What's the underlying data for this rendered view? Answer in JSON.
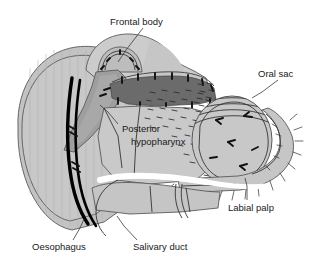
{
  "figure": {
    "background_color": "#ffffff",
    "width": 320,
    "height": 267
  },
  "palette": {
    "head_capsule": "#c3c3c3",
    "head_capsule_light": "#cfcfcf",
    "pharynx_dark": "#6b6b6b",
    "pharynx_mid": "#9a9a9a",
    "oral_sac": "#c8c8c8",
    "labial_palp": "#c6c6c6",
    "oesophagus": "#000000",
    "outline": "#5a5a5a",
    "label_text": "#1a1a1a",
    "leader_line": "#3a3a3a",
    "white_band": "#ffffff"
  },
  "labels": [
    {
      "id": "frontal-body",
      "text": "Frontal body",
      "x": 110,
      "y": 22,
      "anchor": "start",
      "leader": "M 143 28 L 126 50 L 118 62"
    },
    {
      "id": "oral-sac",
      "text": "Oral sac",
      "x": 258,
      "y": 74,
      "anchor": "start",
      "leader": "M 278 80 L 262 92 L 252 98"
    },
    {
      "id": "posterior-hypopharynx",
      "line1": "Posterior",
      "line2": "hypopharynx",
      "x": 122,
      "y": 129,
      "x2": 131,
      "y2": 142,
      "anchor": "start",
      "leader": "M 118 124 L 108 112 L 100 105"
    },
    {
      "id": "labial-palp",
      "text": "Labial palp",
      "x": 228,
      "y": 208,
      "anchor": "start",
      "leader": "M 247 200 L 247 186 L 245 178"
    },
    {
      "id": "oesophagus",
      "text": "Oesophagus",
      "x": 32,
      "y": 247,
      "anchor": "start",
      "leader": "M 73 240 L 80 228 L 84 219"
    },
    {
      "id": "salivary-duct",
      "text": "Salivary duct",
      "x": 133,
      "y": 247,
      "anchor": "start",
      "leader": "M 137 240 L 124 226 L 117 216"
    }
  ],
  "structures": [
    {
      "id": "head-capsule",
      "name": "head capsule",
      "fill": "#c3c3c3"
    },
    {
      "id": "frontal-body-dome",
      "name": "frontal body",
      "fill": "#b8b8b8"
    },
    {
      "id": "pharynx",
      "name": "posterior hypopharynx",
      "fill": "#6b6b6b"
    },
    {
      "id": "oral-sac-body",
      "name": "oral sac",
      "fill": "#c8c8c8"
    },
    {
      "id": "labial-palp-limb",
      "name": "labial palp",
      "fill": "#c6c6c6"
    },
    {
      "id": "oesophagus-tube",
      "name": "oesophagus",
      "fill": "#000000"
    },
    {
      "id": "salivary-duct-line",
      "name": "salivary duct",
      "fill": "none"
    }
  ]
}
